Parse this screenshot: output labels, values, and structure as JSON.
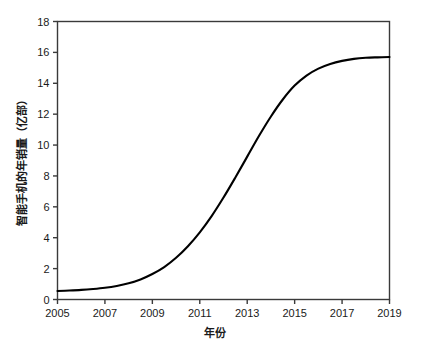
{
  "chart_data": {
    "type": "line",
    "title": "",
    "xlabel": "年份",
    "ylabel": "智能手机的年销量（亿部）",
    "xlim": [
      2005,
      2019
    ],
    "ylim": [
      0,
      18
    ],
    "grid": false,
    "legend": false,
    "line_color": "#000000",
    "axis_color": "#3a3a3a",
    "background": "#ffffff",
    "xticks": [
      2005,
      2007,
      2009,
      2011,
      2013,
      2015,
      2017,
      2019
    ],
    "xtick_labels": [
      "2005",
      "2007",
      "2009",
      "2011",
      "2013",
      "2015",
      "2017",
      "2019"
    ],
    "yticks": [
      0,
      2,
      4,
      6,
      8,
      10,
      12,
      14,
      16,
      18
    ],
    "ytick_labels": [
      "0",
      "2",
      "4",
      "6",
      "8",
      "10",
      "12",
      "14",
      "16",
      "18"
    ],
    "x": [
      2005,
      2005.5,
      2006,
      2006.5,
      2007,
      2007.5,
      2008,
      2008.5,
      2009,
      2009.5,
      2010,
      2010.5,
      2011,
      2011.5,
      2012,
      2012.5,
      2013,
      2013.5,
      2014,
      2014.5,
      2015,
      2015.5,
      2016,
      2016.5,
      2017,
      2017.5,
      2018,
      2018.5,
      2019
    ],
    "values": [
      0.55,
      0.58,
      0.62,
      0.68,
      0.76,
      0.88,
      1.05,
      1.3,
      1.65,
      2.1,
      2.7,
      3.45,
      4.35,
      5.4,
      6.6,
      7.9,
      9.25,
      10.6,
      11.85,
      12.95,
      13.85,
      14.5,
      14.95,
      15.25,
      15.45,
      15.58,
      15.65,
      15.68,
      15.7
    ],
    "series_name": "智能手机的年销量",
    "annotations": []
  }
}
